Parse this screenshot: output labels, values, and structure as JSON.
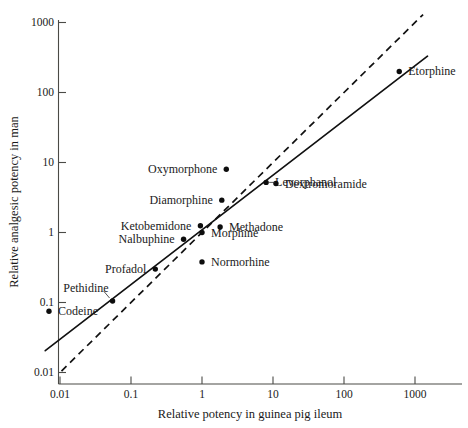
{
  "chart_data": {
    "type": "scatter",
    "title": "",
    "xlabel": "Relative potency in guinea pig ileum",
    "ylabel": "Relative analgesic potency in man",
    "xscale": "log",
    "yscale": "log",
    "xlim": [
      0.004,
      3000
    ],
    "ylim": [
      0.008,
      1400
    ],
    "xticks": [
      "0.01",
      "0.1",
      "1",
      "10",
      "100",
      "1000"
    ],
    "xtick_values": [
      0.01,
      0.1,
      1,
      10,
      100,
      1000
    ],
    "yticks": [
      "0.01",
      "0.1",
      "1",
      "10",
      "100",
      "1000"
    ],
    "ytick_values": [
      0.01,
      0.1,
      1,
      10,
      100,
      1000
    ],
    "grid": false,
    "legend": null,
    "points": [
      {
        "label": "Codeine",
        "x": 0.007,
        "y": 0.075,
        "label_side": "right"
      },
      {
        "label": "Pethidine",
        "x": 0.055,
        "y": 0.105,
        "label_side": "above-left"
      },
      {
        "label": "Profadol",
        "x": 0.22,
        "y": 0.3,
        "label_side": "left"
      },
      {
        "label": "Nalbuphine",
        "x": 0.55,
        "y": 0.8,
        "label_side": "left"
      },
      {
        "label": "Ketobemidone",
        "x": 0.95,
        "y": 1.25,
        "label_side": "left"
      },
      {
        "label": "Morphine",
        "x": 1.0,
        "y": 1.0,
        "label_side": "right"
      },
      {
        "label": "Normorhine",
        "x": 1.0,
        "y": 0.38,
        "label_side": "right"
      },
      {
        "label": "Methadone",
        "x": 1.8,
        "y": 1.2,
        "label_side": "right"
      },
      {
        "label": "Diamorphine",
        "x": 1.9,
        "y": 2.9,
        "label_side": "left"
      },
      {
        "label": "Oxymorphone",
        "x": 2.2,
        "y": 8.0,
        "label_side": "left"
      },
      {
        "label": "Levorphanol",
        "x": 8.0,
        "y": 5.2,
        "label_side": "right"
      },
      {
        "label": "Dextromoramide",
        "x": 11.0,
        "y": 5.0,
        "label_side": "right"
      },
      {
        "label": "Etorphine",
        "x": 600.0,
        "y": 200.0,
        "label_side": "right"
      }
    ],
    "lines": [
      {
        "name": "regression-fit",
        "style": "solid",
        "x0": 0.0062,
        "y0": 0.0205,
        "x1": 1500.0,
        "y1": 330.0
      },
      {
        "name": "line-of-identity",
        "style": "dashed",
        "x0": 0.0105,
        "y0": 0.0105,
        "x1": 1300.0,
        "y1": 1300.0
      }
    ]
  }
}
